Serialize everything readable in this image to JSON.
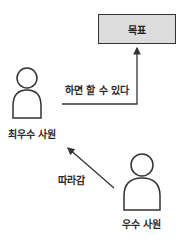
{
  "diagram": {
    "goal": {
      "label": "목표",
      "fill": "#dcdcdc"
    },
    "top_performer": {
      "label": "최우수 사원"
    },
    "good_performer": {
      "label": "우수 사원"
    },
    "edges": [
      {
        "from": "top_performer",
        "to": "goal",
        "label": "하면 할 수 있다"
      },
      {
        "from": "good_performer",
        "to": "top_performer",
        "label": "따라감"
      }
    ],
    "stroke_color": "#333333"
  }
}
